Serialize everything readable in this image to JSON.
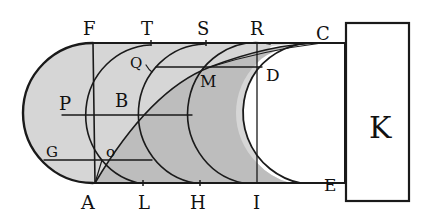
{
  "figure": {
    "colors": {
      "ink": "#1a1a1a",
      "shade_light": "#d6d6d6",
      "shade_dark": "#bdbdbd",
      "paper": "#ffffff"
    },
    "labels": {
      "F": "F",
      "T": "T",
      "S": "S",
      "R": "R",
      "C": "C",
      "Q": "Q",
      "M": "M",
      "D": "D",
      "P": "P",
      "B": "B",
      "G": "G",
      "o": "o",
      "A": "A",
      "L": "L",
      "H": "H",
      "I": "I",
      "E": "E",
      "K": "K"
    }
  }
}
